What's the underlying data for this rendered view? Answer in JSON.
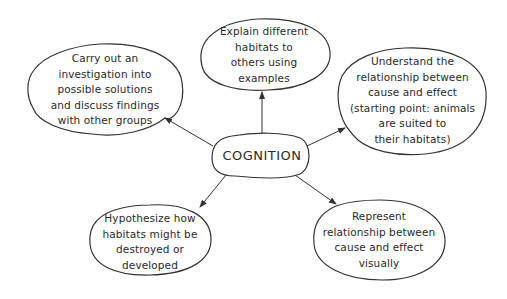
{
  "diagram": {
    "type": "mind-map",
    "center": {
      "label": "COGNITION"
    },
    "nodes": [
      {
        "id": "top-left",
        "label": "Carry out an\ninvestigation into\npossible solutions\nand discuss findings\nwith other groups"
      },
      {
        "id": "top-center",
        "label": "Explain different\nhabitats to\nothers using\nexamples"
      },
      {
        "id": "right",
        "label": "Understand the\nrelationship between\ncause and effect\n(starting point: animals\nare suited to\ntheir habitats)"
      },
      {
        "id": "bottom-left",
        "label": "Hypothesize how\nhabitats might be\ndestroyed or\ndeveloped"
      },
      {
        "id": "bottom-right",
        "label": "Represent\nrelationship between\ncause and effect\nvisually"
      }
    ],
    "edges": [
      {
        "from": "center",
        "to": "top-left",
        "arrow": "to"
      },
      {
        "from": "center",
        "to": "top-center",
        "arrow": "to"
      },
      {
        "from": "center",
        "to": "right",
        "arrow": "to"
      },
      {
        "from": "center",
        "to": "bottom-left",
        "arrow": "to"
      },
      {
        "from": "center",
        "to": "bottom-right",
        "arrow": "to"
      }
    ],
    "colors": {
      "stroke": "#333333",
      "text": "#2a2a2a",
      "background": "#ffffff"
    }
  }
}
